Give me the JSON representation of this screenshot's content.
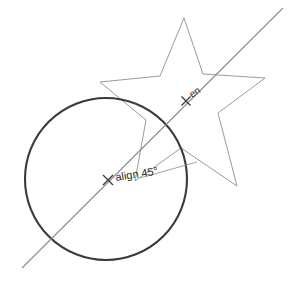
{
  "canvas": {
    "width": 297,
    "height": 281,
    "background": "#ffffff",
    "name": "sketch-canvas"
  },
  "colors": {
    "circle_stroke": "#3a3a3a",
    "star_stroke": "#9a9a9a",
    "construction_line": "#8c8c8c",
    "snap_marker": "#3a3a3a",
    "label_text": "#2b2b2b"
  },
  "shapes": {
    "circle": {
      "label": "circle",
      "cx": 106,
      "cy": 179,
      "r": 81,
      "stroke_width": 2.1
    },
    "star": {
      "label": "star",
      "stroke_width": 1,
      "points": "184,18 203,74 265,78 218,113 237,186 181,148 135,181 146,120 100,82 160,76"
    }
  },
  "construction": {
    "alignment_line": {
      "label": "alignment-line-45",
      "x1": 22,
      "y1": 268,
      "x2": 283,
      "y2": 8,
      "angle_deg": 45,
      "stroke_width": 1
    },
    "leader_line": {
      "label": "leader-line",
      "x1": 140,
      "y1": 178,
      "x2": 197,
      "y2": 162
    }
  },
  "snaps": [
    {
      "id": "align-snap",
      "marker": "x-snap-marker",
      "x": 108,
      "y": 180,
      "label": "align 45°",
      "label_x": 116,
      "label_y": 181
    },
    {
      "id": "endpoint-snap",
      "marker": "x-snap-marker",
      "x": 186,
      "y": 101,
      "label": "en",
      "label_x": 192,
      "label_y": 98
    }
  ]
}
